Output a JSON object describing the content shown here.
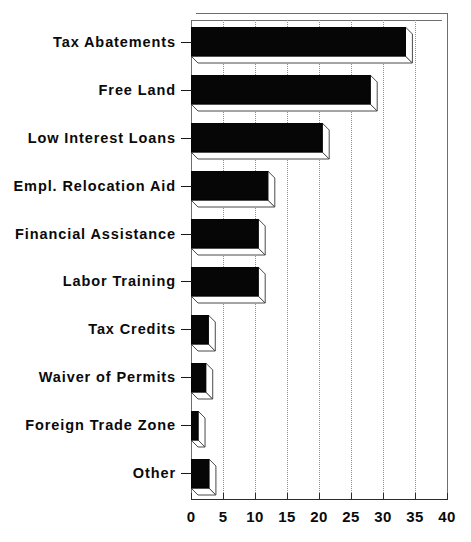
{
  "chart_data": {
    "type": "bar",
    "orientation": "horizontal",
    "title": "",
    "xlabel": "",
    "ylabel": "",
    "categories": [
      "Tax Abatements",
      "Free Land",
      "Low Interest Loans",
      "Empl. Relocation Aid",
      "Financial Assistance",
      "Labor Training",
      "Tax Credits",
      "Waiver of Permits",
      "Foreign Trade Zone",
      "Other"
    ],
    "values": [
      33.5,
      28,
      20.5,
      12,
      10.5,
      10.5,
      2.7,
      2.3,
      1.1,
      2.8
    ],
    "xlim": [
      0,
      40
    ],
    "xticks": [
      0,
      5,
      10,
      15,
      20,
      25,
      30,
      35,
      40
    ],
    "xticklabels": [
      "0",
      "5",
      "10",
      "15",
      "20",
      "25",
      "30",
      "35",
      "40"
    ],
    "grid": "vertical-dotted",
    "legend": null,
    "style": "3d-shadow-black-bars"
  }
}
